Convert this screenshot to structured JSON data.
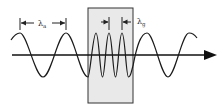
{
  "diagram": {
    "labels": {
      "lambda_a": "λ",
      "lambda_a_sub": "a",
      "lambda_g": "λ",
      "lambda_g_sub": "g"
    },
    "colors": {
      "wave": "#1a1a1a",
      "axis": "#111111",
      "box_fill": "#e9e9e9",
      "box_stroke": "#333333",
      "background": "#ffffff"
    }
  }
}
